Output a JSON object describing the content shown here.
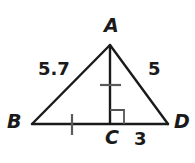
{
  "figure": {
    "kind": "triangle-with-altitude",
    "stroke_color": "#1a1a1a",
    "background_color": "#ffffff",
    "vertices": [
      {
        "name": "A",
        "label": "A",
        "x": 110,
        "y": 45
      },
      {
        "name": "B",
        "label": "B",
        "x": 32,
        "y": 124
      },
      {
        "name": "C",
        "label": "C",
        "x": 110,
        "y": 124
      },
      {
        "name": "D",
        "label": "D",
        "x": 168,
        "y": 124
      }
    ],
    "segments": [
      {
        "name": "segment-AB",
        "from": "B",
        "to": "A"
      },
      {
        "name": "segment-AD",
        "from": "A",
        "to": "D"
      },
      {
        "name": "segment-BD",
        "from": "B",
        "to": "D"
      },
      {
        "name": "segment-AC",
        "from": "A",
        "to": "C"
      }
    ],
    "measure_labels": [
      {
        "name": "length-AB",
        "text": "5.7",
        "side": "AB"
      },
      {
        "name": "length-AD",
        "text": "5",
        "side": "AD"
      },
      {
        "name": "length-CD",
        "text": "3",
        "side": "CD"
      }
    ],
    "congruence_ticks": [
      {
        "name": "tick-on-AC",
        "on": "AC",
        "x": 110,
        "y": 85,
        "orientation": "horizontal"
      },
      {
        "name": "tick-on-BC",
        "on": "BC",
        "x": 72,
        "y": 124,
        "orientation": "vertical"
      }
    ],
    "right_angle": {
      "name": "right-angle-at-C",
      "vertex": "C",
      "size": 14
    }
  }
}
